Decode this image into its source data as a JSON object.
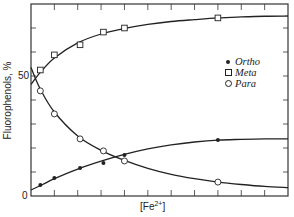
{
  "chart_data": {
    "type": "line",
    "title": "",
    "xlabel": "[Fe2+]",
    "xlabel_base": "[Fe",
    "xlabel_sup": "2+",
    "xlabel_close": "]",
    "ylabel": "Fluorophenols, %",
    "ylim": [
      0,
      80
    ],
    "xlim": [
      0,
      11
    ],
    "y_ticks": [
      0,
      10,
      20,
      30,
      40,
      50,
      60,
      70,
      80
    ],
    "y_tick_labels": [
      {
        "value": 0,
        "label": "0"
      },
      {
        "value": 50,
        "label": "50"
      }
    ],
    "x_ticks": [
      1,
      2,
      3,
      4,
      5,
      6,
      7,
      8,
      9,
      10
    ],
    "x_tick_labels": [],
    "grid": false,
    "legend_position": "right-middle",
    "series": [
      {
        "name": "Ortho",
        "marker": "filled-circle",
        "x": [
          0.4,
          1.0,
          2.1,
          3.1,
          4.0,
          8.0
        ],
        "values": [
          4.6,
          7.5,
          11.7,
          13.8,
          17.1,
          23.3
        ],
        "curve": [
          [
            0,
            2.5
          ],
          [
            0.5,
            4.8
          ],
          [
            1,
            7.2
          ],
          [
            2,
            11.2
          ],
          [
            3,
            14.5
          ],
          [
            4,
            17.3
          ],
          [
            5,
            19.6
          ],
          [
            6,
            21.3
          ],
          [
            7,
            22.5
          ],
          [
            8,
            23.3
          ],
          [
            9,
            23.6
          ],
          [
            10,
            23.8
          ],
          [
            11,
            23.8
          ]
        ]
      },
      {
        "name": "Meta",
        "marker": "open-square",
        "x": [
          0.4,
          1.0,
          2.1,
          3.1,
          4.0,
          8.0
        ],
        "values": [
          52.5,
          58.8,
          63.0,
          68.3,
          70.0,
          74.2
        ],
        "curve": [
          [
            0,
            46.5
          ],
          [
            0.4,
            51.5
          ],
          [
            1,
            57.5
          ],
          [
            2,
            63.8
          ],
          [
            3,
            67.5
          ],
          [
            4,
            69.8
          ],
          [
            5,
            71.5
          ],
          [
            6,
            72.7
          ],
          [
            7,
            73.5
          ],
          [
            8,
            74.2
          ],
          [
            9,
            74.6
          ],
          [
            10,
            74.9
          ],
          [
            11,
            75.0
          ]
        ]
      },
      {
        "name": "Para",
        "marker": "open-circle",
        "x": [
          0.4,
          1.0,
          2.1,
          3.1,
          4.0,
          8.0
        ],
        "values": [
          43.8,
          34.2,
          23.8,
          18.8,
          14.6,
          5.8
        ],
        "curve": [
          [
            0,
            53.5
          ],
          [
            0.4,
            44.5
          ],
          [
            1,
            35.0
          ],
          [
            2,
            25.0
          ],
          [
            3,
            19.0
          ],
          [
            4,
            14.8
          ],
          [
            5,
            11.5
          ],
          [
            6,
            9.0
          ],
          [
            7,
            7.2
          ],
          [
            8,
            5.8
          ],
          [
            9,
            4.8
          ],
          [
            10,
            4.0
          ],
          [
            11,
            3.5
          ]
        ]
      }
    ],
    "colors": {
      "line": "#222222",
      "axis": "#333333",
      "background": "#ffffff"
    }
  },
  "labels": {
    "ylabel": "Fluorophenols, %",
    "y0": "0",
    "y50": "50",
    "xlabel_base": "[Fe",
    "xlabel_sup": "2+",
    "xlabel_close": "]"
  },
  "legend": [
    {
      "name": "Ortho",
      "marker": "filled-circle"
    },
    {
      "name": "Meta",
      "marker": "open-square"
    },
    {
      "name": "Para",
      "marker": "open-circle"
    }
  ]
}
